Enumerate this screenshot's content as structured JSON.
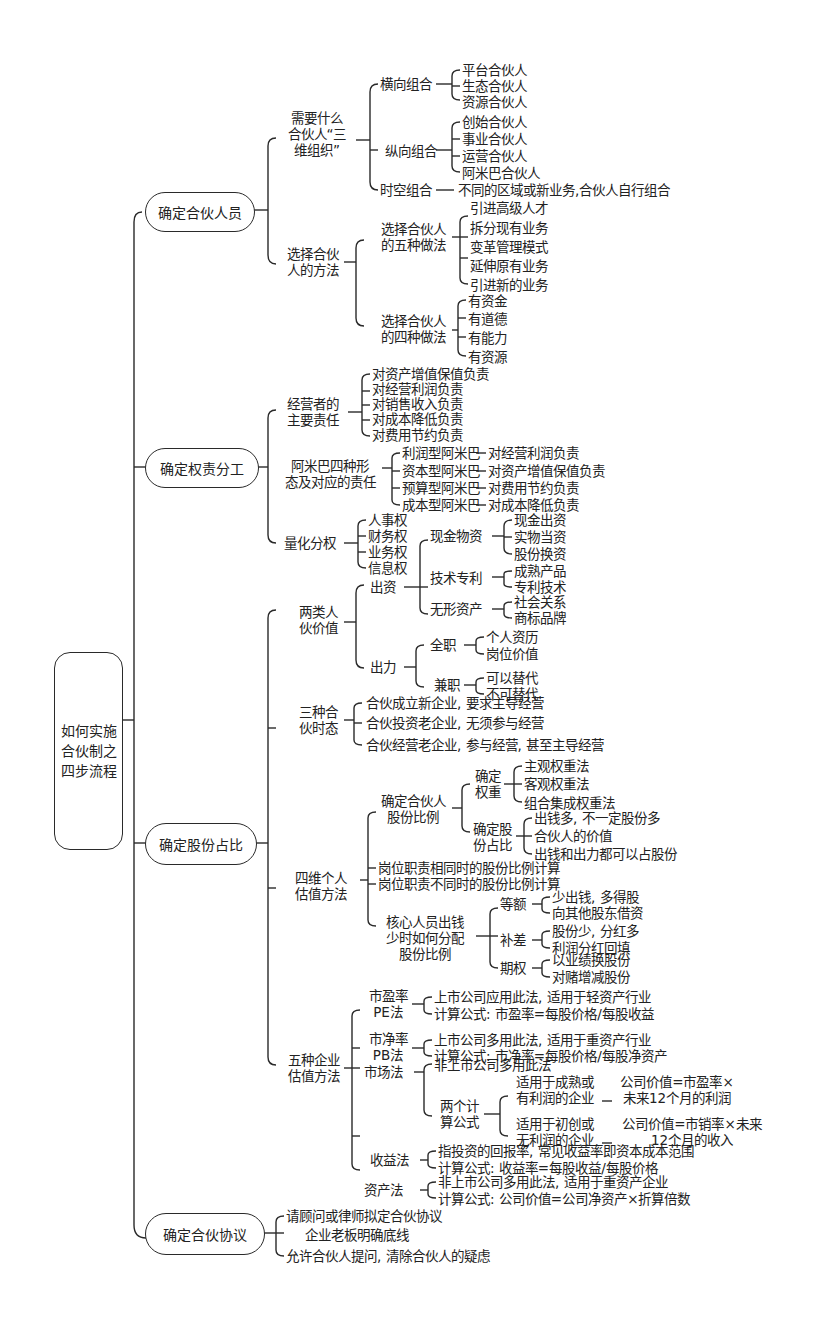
{
  "root": {
    "label_lines": [
      "如何实施",
      "合伙制之",
      "四步流程"
    ]
  },
  "steps": [
    {
      "label": "确定合伙人员",
      "children": [
        {
          "label_lines": [
            "需要什么",
            "合伙人“三",
            "维组织”"
          ],
          "children": [
            {
              "label": "横向组合",
              "items": [
                "平台合伙人",
                "生态合伙人",
                "资源合伙人"
              ]
            },
            {
              "label": "纵向组合",
              "items": [
                "创始合伙人",
                "事业合伙人",
                "运营合伙人",
                "阿米巴合伙人"
              ]
            },
            {
              "label": "时空组合",
              "items": [
                "不同的区域或新业务,合伙人自行组合"
              ]
            }
          ]
        },
        {
          "label_lines": [
            "选择合伙",
            "人的方法"
          ],
          "children": [
            {
              "label_lines": [
                "选择合伙人",
                "的五种做法"
              ],
              "items": [
                "引进高级人才",
                "拆分现有业务",
                "变革管理模式",
                "延伸原有业务",
                "引进新的业务"
              ]
            },
            {
              "label_lines": [
                "选择合伙人",
                "的四种做法"
              ],
              "items": [
                "有资金",
                "有道德",
                "有能力",
                "有资源"
              ]
            }
          ]
        }
      ]
    },
    {
      "label": "确定权责分工",
      "children": [
        {
          "label_lines": [
            "经营者的",
            "主要责任"
          ],
          "items": [
            "对资产增值保值负责",
            "对经营利润负责",
            "对销售收入负责",
            "对成本降低负责",
            "对费用节约负责"
          ]
        },
        {
          "label_lines": [
            "阿米巴四种形",
            "态及对应的责任"
          ],
          "items": [
            {
              "type": "利润型阿米巴",
              "duty": "对经营利润负责"
            },
            {
              "type": "资本型阿米巴",
              "duty": "对资产增值保值负责"
            },
            {
              "type": "预算型阿米巴",
              "duty": "对费用节约负责"
            },
            {
              "type": "成本型阿米巴",
              "duty": "对成本降低负责"
            }
          ]
        },
        {
          "label": "量化分权",
          "items": [
            "人事权",
            "财务权",
            "业务权",
            "信息权"
          ]
        }
      ]
    },
    {
      "label": "确定股份占比",
      "children": [
        {
          "label_lines": [
            "两类人",
            "伙价值"
          ],
          "children": [
            {
              "label": "出资",
              "children": [
                {
                  "label": "现金物资",
                  "items": [
                    "现金出资",
                    "实物当资",
                    "股份换资"
                  ]
                },
                {
                  "label": "技术专利",
                  "items": [
                    "成熟产品",
                    "专利技术"
                  ]
                },
                {
                  "label": "无形资产",
                  "items": [
                    "社会关系",
                    "商标品牌"
                  ]
                }
              ]
            },
            {
              "label": "出力",
              "children": [
                {
                  "label": "全职",
                  "items": [
                    "个人资历",
                    "岗位价值"
                  ]
                },
                {
                  "label": "兼职",
                  "items": [
                    "可以替代",
                    "不可替代"
                  ]
                }
              ]
            }
          ]
        },
        {
          "label_lines": [
            "三种合",
            "伙时态"
          ],
          "items": [
            "合伙成立新企业, 要求主导经营",
            "合伙投资老企业, 无须参与经营",
            "合伙经营老企业, 参与经营, 甚至主导经营"
          ]
        },
        {
          "label_lines": [
            "四维个人",
            "估值方法"
          ],
          "children": [
            {
              "label_lines": [
                "确定合伙人",
                "股份比例"
              ],
              "children": [
                {
                  "label_lines": [
                    "确定",
                    "权重"
                  ],
                  "items": [
                    "主观权重法",
                    "客观权重法",
                    "组合集成权重法"
                  ]
                },
                {
                  "label_lines": [
                    "确定股",
                    "份占比"
                  ],
                  "items": [
                    "出钱多, 不一定股份多",
                    "合伙人的价值",
                    "出钱和出力都可以占股份"
                  ]
                }
              ]
            },
            {
              "label": "岗位职责相同时的股份比例计算"
            },
            {
              "label": "岗位职责不同时的股份比例计算"
            },
            {
              "label_lines": [
                "核心人员出钱",
                "少时如何分配",
                "股份比例"
              ],
              "children": [
                {
                  "label": "等额",
                  "items": [
                    "少出钱, 多得股",
                    "向其他股东借资"
                  ]
                },
                {
                  "label": "补差",
                  "items": [
                    "股份少, 分红多",
                    "利润分红回填"
                  ]
                },
                {
                  "label": "期权",
                  "items": [
                    "以业绩换股份",
                    "对赌增减股份"
                  ]
                }
              ]
            }
          ]
        },
        {
          "label_lines": [
            "五种企业",
            "估值方法"
          ],
          "children": [
            {
              "label_lines": [
                "市盈率",
                "PE法"
              ],
              "items": [
                "上市公司应用此法, 适用于轻资产行业",
                "计算公式: 市盈率=每股价格/每股收益"
              ]
            },
            {
              "label_lines": [
                "市净率",
                "PB法"
              ],
              "items": [
                "上市公司多用此法, 适用于重资产行业",
                "计算公式: 市净率=每股价格/每股净资产"
              ]
            },
            {
              "label": "市场法",
              "items": [
                "非上市公司多用此法"
              ],
              "formulas": {
                "label_lines": [
                  "两个计",
                  "算公式"
                ],
                "cases": [
                  {
                    "condition_lines": [
                      "适用于成熟或",
                      "有利润的企业"
                    ],
                    "formula_lines": [
                      "公司价值=市盈率×",
                      "未来12个月的利润"
                    ]
                  },
                  {
                    "condition_lines": [
                      "适用于初创或",
                      "无利润的企业"
                    ],
                    "formula_lines": [
                      "公司价值=市销率×未来",
                      "12个月的收入"
                    ]
                  }
                ]
              }
            },
            {
              "label": "收益法",
              "items": [
                "指投资的回报率, 常见收益率即资本成本范围",
                "计算公式: 收益率=每股收益/每股价格"
              ]
            },
            {
              "label": "资产法",
              "items": [
                "非上市公司多用此法, 适用于重资产企业",
                "计算公式: 公司价值=公司净资产×折算倍数"
              ]
            }
          ]
        }
      ]
    },
    {
      "label": "确定合伙协议",
      "items": [
        "请顾问或律师拟定合伙协议",
        "企业老板明确底线",
        "允许合伙人提问, 清除合伙人的疑虑"
      ]
    }
  ]
}
